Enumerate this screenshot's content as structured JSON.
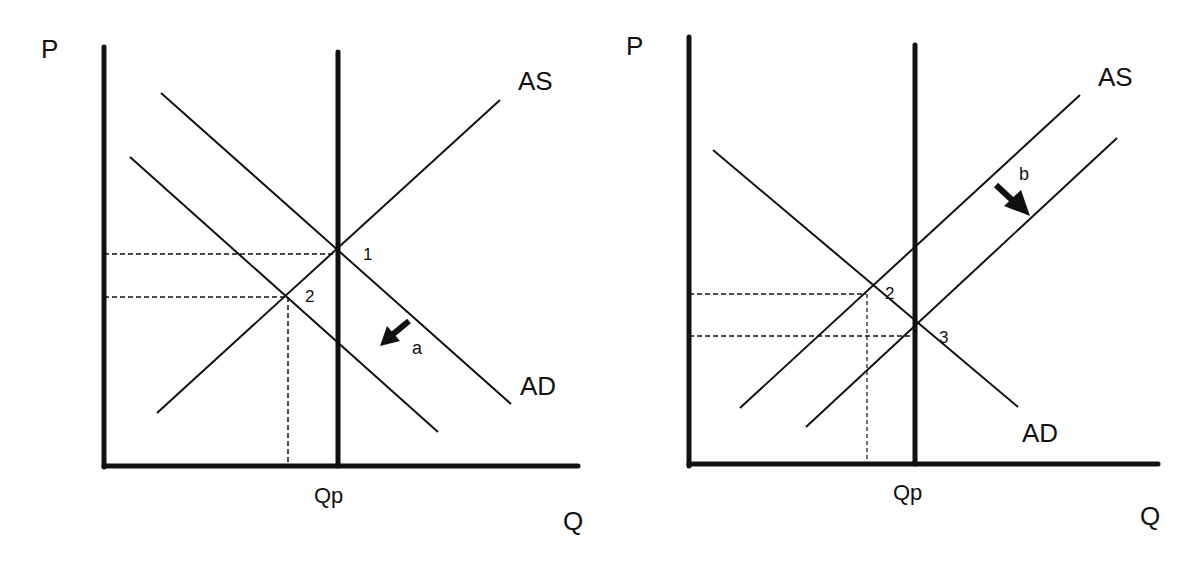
{
  "figure": {
    "type": "economics AS-AD diagrams",
    "panels": [
      {
        "id": "left",
        "y_axis_label": "P",
        "x_axis_label": "Q",
        "potential_output_label": "Qp",
        "supply_label": "AS",
        "demand_label": "AD",
        "points": [
          "1",
          "2"
        ],
        "shift_arrow_label": "a",
        "description": "AD shifts left (arrow a); equilibrium moves from 1 to 2"
      },
      {
        "id": "right",
        "y_axis_label": "P",
        "x_axis_label": "Q",
        "potential_output_label": "Qp",
        "supply_label": "AS",
        "demand_label": "AD",
        "points": [
          "2",
          "3"
        ],
        "shift_arrow_label": "b",
        "description": "AS shifts right (arrow b); equilibrium moves from 2 to 3"
      }
    ]
  },
  "colors": {
    "line": "#111111",
    "background": "#ffffff"
  }
}
